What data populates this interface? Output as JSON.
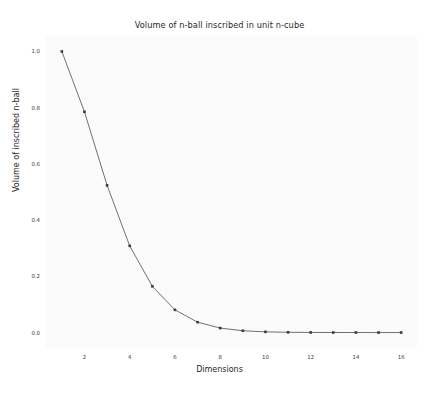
{
  "chart_data": {
    "type": "line",
    "title": "Volume of n-ball inscribed in unit n-cube",
    "xlabel": "Dimensions",
    "ylabel": "Volume of inscribed n-ball",
    "x": [
      1,
      2,
      3,
      4,
      5,
      6,
      7,
      8,
      9,
      10,
      11,
      12,
      13,
      14,
      15,
      16
    ],
    "values": [
      1.0,
      0.7854,
      0.5236,
      0.3084,
      0.1645,
      0.0807,
      0.0369,
      0.0159,
      0.0064,
      0.0025,
      0.0009,
      0.0003,
      0.0001,
      4e-05,
      1e-05,
      4e-06
    ],
    "series": [
      {
        "name": "Volume of inscribed n-ball",
        "values": [
          1.0,
          0.7854,
          0.5236,
          0.3084,
          0.1645,
          0.0807,
          0.0369,
          0.0159,
          0.0064,
          0.0025,
          0.0009,
          0.0003,
          0.0001,
          4e-05,
          1e-05,
          4e-06
        ]
      }
    ],
    "xlim": [
      0.3,
      16.7
    ],
    "ylim": [
      -0.055,
      1.055
    ],
    "xticks": [
      2,
      4,
      6,
      8,
      10,
      12,
      14,
      16
    ],
    "xtick_labels": [
      "2",
      "4",
      "6",
      "8",
      "10",
      "12",
      "14",
      "16"
    ],
    "yticks": [
      0.0,
      0.2,
      0.4,
      0.6,
      0.8,
      1.0
    ],
    "ytick_labels": [
      "0.0",
      "0.2",
      "0.4",
      "0.6",
      "0.8",
      "1.0"
    ],
    "grid": false,
    "legend": "none",
    "line_color": "#4d4d4d",
    "marker_color": "#3a3a3a",
    "marker": "square",
    "plot_background": "#fbfbfb",
    "figure_background": "#ffffff"
  }
}
